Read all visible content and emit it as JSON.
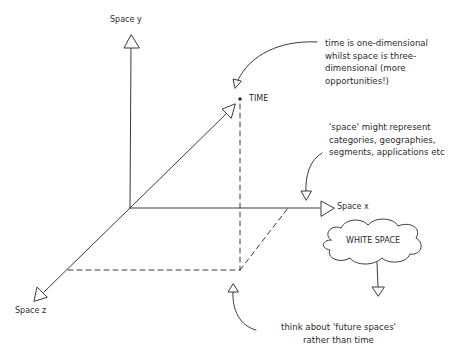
{
  "diagram": {
    "axes": {
      "y": {
        "label": "Space y"
      },
      "x": {
        "label": "Space x"
      },
      "z": {
        "label": "Space z"
      }
    },
    "point": {
      "label": "TIME"
    },
    "cloud": {
      "label": "WHITE SPACE"
    },
    "annotations": {
      "time_note": {
        "lines": [
          "time is one-dimensional",
          "whilst space is three-",
          "dimensional (more",
          "opportunities!)"
        ]
      },
      "space_note": {
        "lines": [
          "'space' might represent",
          "categories, geographies,",
          "segments, applications etc"
        ]
      },
      "future_note": {
        "lines": [
          "think about 'future spaces'",
          "rather than time"
        ]
      }
    },
    "colors": {
      "stroke": "#3a3a3a",
      "background": "#ffffff"
    }
  }
}
